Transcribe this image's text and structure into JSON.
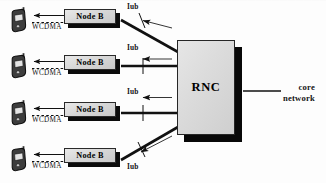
{
  "diagram": {
    "colors": {
      "ink": "#141414",
      "box_face": "#dcdcdc",
      "box_shadow": "#0b0b0b",
      "phone_body": "#3a3a3a"
    },
    "access_links": [
      {
        "id": 1,
        "label": "WCDMA",
        "style": "dashed",
        "direction": "node-b-to-ue"
      },
      {
        "id": 2,
        "label": "WCDMA",
        "style": "dashed",
        "direction": "node-b-to-ue"
      },
      {
        "id": 3,
        "label": "WCDMA",
        "style": "dashed",
        "direction": "node-b-to-ue"
      },
      {
        "id": 4,
        "label": "WCDMA",
        "style": "dashed",
        "direction": "node-b-to-ue"
      }
    ],
    "base_stations": [
      {
        "id": 1,
        "label": "Node B"
      },
      {
        "id": 2,
        "label": "Node B"
      },
      {
        "id": 3,
        "label": "Node B"
      },
      {
        "id": 4,
        "label": "Node B"
      }
    ],
    "iub_links": [
      {
        "id": 1,
        "label": "Iub",
        "from": "Node B",
        "to": "RNC"
      },
      {
        "id": 2,
        "label": "Iub",
        "from": "Node B",
        "to": "RNC"
      },
      {
        "id": 3,
        "label": "Iub",
        "from": "Node B",
        "to": "RNC"
      },
      {
        "id": 4,
        "label": "Iub",
        "from": "Node B",
        "to": "RNC"
      }
    ],
    "controller": {
      "label": "RNC"
    },
    "core": {
      "line1": "core",
      "line2": "network"
    },
    "terminals": [
      {
        "id": 1,
        "name": "mobile-handset"
      },
      {
        "id": 2,
        "name": "mobile-handset"
      },
      {
        "id": 3,
        "name": "mobile-handset"
      },
      {
        "id": 4,
        "name": "mobile-handset"
      }
    ]
  }
}
